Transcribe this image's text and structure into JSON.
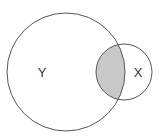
{
  "diagram": {
    "type": "venn",
    "sets": [
      {
        "label": "Y",
        "cx": 66,
        "cy": 72,
        "r": 59
      },
      {
        "label": "X",
        "cx": 124,
        "cy": 72,
        "r": 28
      }
    ],
    "shaded_region": "intersection",
    "colors": {
      "stroke": "#555555",
      "shade": "#c9c9c9",
      "background": "#ffffff"
    }
  }
}
